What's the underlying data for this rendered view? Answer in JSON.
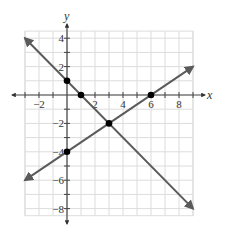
{
  "chart_data": {
    "type": "line",
    "title": "",
    "xlabel": "x",
    "ylabel": "y",
    "xlim": [
      -3,
      9
    ],
    "ylim": [
      -8.5,
      4.5
    ],
    "grid": true,
    "grid_step": 1,
    "x_ticks": [
      -2,
      2,
      4,
      6,
      8
    ],
    "y_ticks": [
      4,
      2,
      -2,
      -4,
      -6,
      -8
    ],
    "series": [
      {
        "name": "line-1",
        "equation": "y = -x + 1",
        "x": [
          -3,
          9
        ],
        "y": [
          4,
          -8
        ],
        "arrows": true
      },
      {
        "name": "line-2",
        "equation": "y = (2/3)x - 4",
        "x": [
          -3,
          9
        ],
        "y": [
          -6,
          2
        ],
        "arrows": true
      }
    ],
    "points": [
      {
        "x": 0,
        "y": 1
      },
      {
        "x": 1,
        "y": 0
      },
      {
        "x": 3,
        "y": -2
      },
      {
        "x": 0,
        "y": -4
      },
      {
        "x": 6,
        "y": 0
      }
    ]
  },
  "colors": {
    "grid": "#dcdcdc",
    "axis": "#444444",
    "line": "#5a5a5a",
    "point": "#000000"
  },
  "labels": {
    "x_axis": "x",
    "y_axis": "y",
    "x_ticks": [
      "−2",
      "2",
      "4",
      "6",
      "8"
    ],
    "y_ticks": [
      "4",
      "2",
      "−2",
      "−4",
      "−6",
      "−8"
    ]
  }
}
